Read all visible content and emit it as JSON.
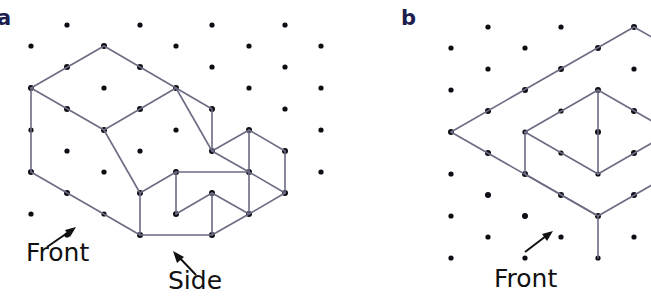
{
  "figure": {
    "type": "isometric-dot-grid-drawing",
    "caption_labels": {
      "a": "a",
      "b": "b"
    },
    "colors": {
      "dot": "#0d0d14",
      "edge": "#6b6b84",
      "label": "#1d1d50",
      "text": "#111111",
      "background": "#ffffff"
    },
    "grid": {
      "description": "isometric dot lattice",
      "dx": 36.3,
      "dy": 21.0,
      "dot_radius": 2.6
    }
  },
  "panel_a": {
    "label": "a",
    "annotations": [
      {
        "name": "front",
        "text": "Front",
        "arrow": "up-right"
      },
      {
        "name": "side",
        "text": "Side",
        "arrow": "up-left"
      }
    ],
    "object": "stepped solid with sloped top face and small cube block at lower right",
    "dots": [
      [
        67,
        25
      ],
      [
        140,
        25
      ],
      [
        212,
        25
      ],
      [
        285,
        25
      ],
      [
        31,
        46
      ],
      [
        104,
        46
      ],
      [
        176,
        46
      ],
      [
        249,
        46
      ],
      [
        321,
        46
      ],
      [
        67,
        67
      ],
      [
        140,
        67
      ],
      [
        212,
        67
      ],
      [
        285,
        67
      ],
      [
        31,
        88
      ],
      [
        104,
        88
      ],
      [
        176,
        88
      ],
      [
        249,
        88
      ],
      [
        321,
        88
      ],
      [
        67,
        109
      ],
      [
        140,
        109
      ],
      [
        212,
        109
      ],
      [
        285,
        109
      ],
      [
        31,
        130
      ],
      [
        104,
        130
      ],
      [
        176,
        130
      ],
      [
        249,
        130
      ],
      [
        321,
        130
      ],
      [
        67,
        151
      ],
      [
        140,
        151
      ],
      [
        212,
        151
      ],
      [
        285,
        151
      ],
      [
        31,
        172
      ],
      [
        104,
        172
      ],
      [
        176,
        172
      ],
      [
        249,
        172
      ],
      [
        321,
        172
      ],
      [
        67,
        193
      ],
      [
        140,
        193
      ],
      [
        212,
        193
      ],
      [
        285,
        193
      ],
      [
        31,
        214
      ],
      [
        104,
        214
      ],
      [
        176,
        214
      ],
      [
        249,
        214
      ],
      [
        67,
        235
      ]
    ],
    "edges": [
      [
        104,
        46,
        31,
        88
      ],
      [
        104,
        46,
        176,
        88
      ],
      [
        31,
        88,
        31,
        172
      ],
      [
        31,
        88,
        104,
        130
      ],
      [
        176,
        88,
        104,
        130
      ],
      [
        176,
        88,
        212,
        109
      ],
      [
        104,
        130,
        140,
        193
      ],
      [
        212,
        109,
        212,
        151
      ],
      [
        140,
        193,
        140,
        235
      ],
      [
        140,
        193,
        176,
        172
      ],
      [
        31,
        172,
        140,
        235
      ],
      [
        140,
        235,
        212,
        193
      ],
      [
        176,
        172,
        176,
        214
      ],
      [
        176,
        172,
        249,
        172
      ],
      [
        212,
        151,
        249,
        130
      ],
      [
        212,
        151,
        285,
        151
      ],
      [
        249,
        130,
        249,
        172
      ],
      [
        176,
        214,
        249,
        214
      ],
      [
        176,
        214,
        212,
        193
      ],
      [
        249,
        172,
        285,
        151
      ],
      [
        249,
        172,
        249,
        214
      ],
      [
        285,
        151,
        285,
        193
      ],
      [
        285,
        193,
        249,
        214
      ],
      [
        212,
        193,
        212,
        235
      ],
      [
        212,
        235,
        285,
        193
      ]
    ]
  },
  "panel_b": {
    "label": "b",
    "annotations": [
      {
        "name": "front",
        "text": "Front",
        "arrow": "up-right"
      }
    ],
    "object": "flat rectangular slab with rectangular notch / inner cube recess at right",
    "dots": [
      [
        488,
        27
      ],
      [
        561,
        27
      ],
      [
        634,
        27
      ],
      [
        451,
        48
      ],
      [
        525,
        48
      ],
      [
        598,
        48
      ],
      [
        488,
        69
      ],
      [
        561,
        69
      ],
      [
        634,
        69
      ],
      [
        451,
        90
      ],
      [
        525,
        90
      ],
      [
        598,
        90
      ],
      [
        488,
        111
      ],
      [
        561,
        111
      ],
      [
        634,
        111
      ],
      [
        451,
        132
      ],
      [
        525,
        132
      ],
      [
        598,
        132
      ],
      [
        488,
        153
      ],
      [
        561,
        153
      ],
      [
        634,
        153
      ],
      [
        451,
        174
      ],
      [
        525,
        174
      ],
      [
        598,
        174
      ],
      [
        488,
        195
      ],
      [
        561,
        195
      ],
      [
        634,
        195
      ],
      [
        451,
        216
      ],
      [
        525,
        216
      ],
      [
        598,
        216
      ],
      [
        488,
        237
      ],
      [
        561,
        237
      ],
      [
        634,
        237
      ],
      [
        451,
        258
      ],
      [
        525,
        258
      ],
      [
        598,
        258
      ]
    ],
    "edges": [
      [
        451,
        132,
        598,
        48
      ],
      [
        598,
        48,
        671,
        90
      ],
      [
        451,
        132,
        598,
        216
      ],
      [
        598,
        216,
        671,
        174
      ],
      [
        525,
        90,
        598,
        132
      ],
      [
        598,
        132,
        671,
        90
      ],
      [
        525,
        90,
        525,
        153
      ],
      [
        598,
        132,
        598,
        195
      ],
      [
        525,
        153,
        598,
        195
      ],
      [
        598,
        195,
        671,
        153
      ],
      [
        671,
        90,
        671,
        153
      ],
      [
        598,
        132,
        598,
        195
      ],
      [
        525,
        153,
        525,
        153
      ],
      [
        598,
        195,
        598,
        258
      ],
      [
        525,
        90,
        561,
        69
      ],
      [
        561,
        69,
        598,
        90
      ]
    ]
  }
}
